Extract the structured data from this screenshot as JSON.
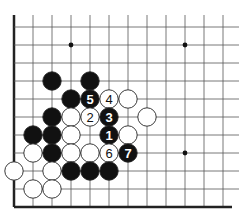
{
  "board": {
    "grid": {
      "origin_x": 14,
      "origin_y": 27,
      "dx": 19,
      "dy": 18,
      "cols": 12,
      "rows": 11,
      "right_open": true,
      "top_open": true,
      "left_edge": true,
      "bottom_edge": true
    },
    "colors": {
      "line": "#555555",
      "edge": "#222222",
      "black": "#111111",
      "white": "#ffffff",
      "stone_outline": "#222222"
    },
    "hoshi": [
      {
        "c": 3,
        "r": 1
      },
      {
        "c": 9,
        "r": 1
      },
      {
        "c": 9,
        "r": 7
      }
    ],
    "stones": [
      {
        "c": 2,
        "r": 3,
        "color": "black",
        "label": ""
      },
      {
        "c": 4,
        "r": 3,
        "color": "black",
        "label": ""
      },
      {
        "c": 3,
        "r": 4,
        "color": "black",
        "label": ""
      },
      {
        "c": 4,
        "r": 4,
        "color": "black",
        "label": "5"
      },
      {
        "c": 5,
        "r": 4,
        "color": "white",
        "label": "4"
      },
      {
        "c": 6,
        "r": 4,
        "color": "white",
        "label": ""
      },
      {
        "c": 2,
        "r": 5,
        "color": "black",
        "label": ""
      },
      {
        "c": 3,
        "r": 5,
        "color": "white",
        "label": ""
      },
      {
        "c": 4,
        "r": 5,
        "color": "white",
        "label": "2"
      },
      {
        "c": 5,
        "r": 5,
        "color": "black",
        "label": "3"
      },
      {
        "c": 7,
        "r": 5,
        "color": "white",
        "label": ""
      },
      {
        "c": 1,
        "r": 6,
        "color": "black",
        "label": ""
      },
      {
        "c": 2,
        "r": 6,
        "color": "black",
        "label": ""
      },
      {
        "c": 3,
        "r": 6,
        "color": "white",
        "label": ""
      },
      {
        "c": 5,
        "r": 6,
        "color": "black",
        "label": "1"
      },
      {
        "c": 6,
        "r": 6,
        "color": "white",
        "label": ""
      },
      {
        "c": 1,
        "r": 7,
        "color": "white",
        "label": ""
      },
      {
        "c": 2,
        "r": 7,
        "color": "black",
        "label": ""
      },
      {
        "c": 3,
        "r": 7,
        "color": "white",
        "label": ""
      },
      {
        "c": 4,
        "r": 7,
        "color": "white",
        "label": ""
      },
      {
        "c": 5,
        "r": 7,
        "color": "white",
        "label": "6"
      },
      {
        "c": 6,
        "r": 7,
        "color": "black",
        "label": "7"
      },
      {
        "c": 0,
        "r": 8,
        "color": "white",
        "label": ""
      },
      {
        "c": 2,
        "r": 8,
        "color": "white",
        "label": ""
      },
      {
        "c": 3,
        "r": 8,
        "color": "black",
        "label": ""
      },
      {
        "c": 4,
        "r": 8,
        "color": "black",
        "label": ""
      },
      {
        "c": 5,
        "r": 8,
        "color": "black",
        "label": ""
      },
      {
        "c": 1,
        "r": 9,
        "color": "white",
        "label": ""
      },
      {
        "c": 2,
        "r": 9,
        "color": "white",
        "label": ""
      }
    ]
  }
}
